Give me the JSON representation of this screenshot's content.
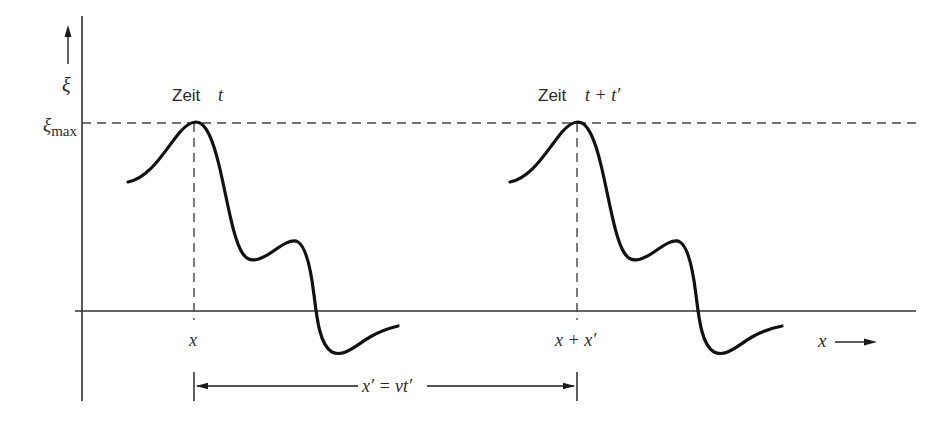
{
  "figure": {
    "colors": {
      "background": "#ffffff",
      "ink": "#1a1a1a",
      "axis": "#333333",
      "dashed": "#444444"
    },
    "y_axis": {
      "symbol": "ξ",
      "arrow_icon": "arrow-up"
    },
    "x_axis": {
      "symbol": "x",
      "arrow_icon": "arrow-right"
    },
    "max_level": {
      "label_base": "ξ",
      "label_sub": "max"
    },
    "pulse_1": {
      "title_word": "Zeit",
      "title_time": "t",
      "peak_position_label": "x"
    },
    "pulse_2": {
      "title_word": "Zeit",
      "title_time": "t + t′",
      "peak_position_label": "x + x′"
    },
    "displacement": {
      "label": "x′ = vt′"
    }
  }
}
